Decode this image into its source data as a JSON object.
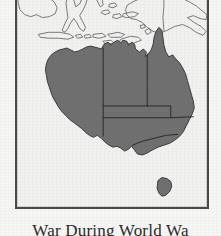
{
  "figure": {
    "caption": "War During World Wa",
    "frame_color": "#4a4a4a",
    "ocean_color": "#f2f2f0",
    "page_background": "#f6f6f4"
  },
  "map": {
    "title": "Australia",
    "projection_box": {
      "x": 15,
      "y": -4,
      "width": 194,
      "height": 213
    },
    "land_fill_highlight": "#707070",
    "land_outline_color": "#3a3a3a",
    "neighbour_outline_color": "#6f6f6f",
    "state_border_color": "#2e2e2e",
    "highlighted_country": "Australia",
    "regions": [
      {
        "name": "Western Australia",
        "abbr": "WA",
        "highlighted": true
      },
      {
        "name": "Northern Territory",
        "abbr": "NT",
        "highlighted": true
      },
      {
        "name": "Queensland",
        "abbr": "QLD",
        "highlighted": true
      },
      {
        "name": "South Australia",
        "abbr": "SA",
        "highlighted": true
      },
      {
        "name": "New South Wales",
        "abbr": "NSW",
        "highlighted": true
      },
      {
        "name": "Victoria",
        "abbr": "VIC",
        "highlighted": true
      },
      {
        "name": "Tasmania",
        "abbr": "TAS",
        "highlighted": true
      }
    ],
    "neighbours": [
      {
        "name": "Borneo",
        "highlighted": false
      },
      {
        "name": "Sulawesi",
        "highlighted": false
      },
      {
        "name": "Java",
        "highlighted": false
      },
      {
        "name": "Lesser Sunda Islands",
        "highlighted": false
      },
      {
        "name": "Timor",
        "highlighted": false
      },
      {
        "name": "New Guinea",
        "highlighted": false
      },
      {
        "name": "Papua New Guinea",
        "highlighted": false
      }
    ]
  }
}
